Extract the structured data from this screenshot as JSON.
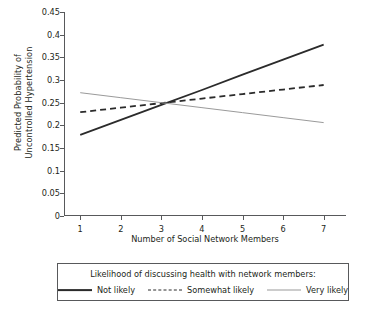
{
  "chart_data": {
    "type": "line",
    "title": "",
    "xlabel": "Number of Social Network Members",
    "ylabel_line1": "Predicted Probability of",
    "ylabel_line2": "Uncontrolled Hypertension",
    "x": [
      1,
      2,
      3,
      4,
      5,
      6,
      7
    ],
    "xlim": [
      0.6,
      7.55
    ],
    "ylim": [
      0,
      0.45
    ],
    "xticks": [
      "1",
      "2",
      "3",
      "4",
      "5",
      "6",
      "7"
    ],
    "yticks": [
      "0",
      "0.05",
      "0.1",
      "0.15",
      "0.2",
      "0.25",
      "0.3",
      "0.35",
      "0.4",
      "0.45"
    ],
    "ytick_values": [
      0,
      0.05,
      0.1,
      0.15,
      0.2,
      0.25,
      0.3,
      0.35,
      0.4,
      0.45
    ],
    "grid": false,
    "legend_position": "below-plot",
    "legend_title": "Likelihood of discussing health with network members:",
    "series": [
      {
        "name": "Not likely",
        "style": "solid",
        "color": "#2b2b2b",
        "width": 1.8,
        "values": [
          0.179,
          0.212,
          0.245,
          0.278,
          0.312,
          0.345,
          0.378
        ]
      },
      {
        "name": "Somewhat likely",
        "style": "dashed",
        "color": "#2b2b2b",
        "width": 1.8,
        "values": [
          0.229,
          0.239,
          0.249,
          0.259,
          0.269,
          0.279,
          0.289
        ]
      },
      {
        "name": "Very likely",
        "style": "solid-thin",
        "color": "#9a9a9a",
        "width": 1.0,
        "values": [
          0.272,
          0.261,
          0.25,
          0.239,
          0.228,
          0.217,
          0.206
        ]
      }
    ]
  }
}
